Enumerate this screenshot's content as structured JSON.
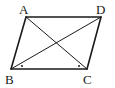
{
  "figure": {
    "type": "parallelogram-with-diagonals",
    "vertices": {
      "A": {
        "label": "A",
        "x": 26,
        "y": 17
      },
      "D": {
        "label": "D",
        "x": 101,
        "y": 17
      },
      "B": {
        "label": "B",
        "x": 11,
        "y": 69
      },
      "C": {
        "label": "C",
        "x": 87,
        "y": 69
      }
    },
    "sides": [
      "AB",
      "BC",
      "CD",
      "DA"
    ],
    "diagonals": [
      "AC",
      "BD"
    ],
    "angle_marks": [
      {
        "at": "B",
        "style": "dot"
      },
      {
        "at": "C",
        "style": "dot"
      }
    ],
    "colors": {
      "stroke": "#1a1a1a",
      "background": "#ffffff"
    }
  }
}
